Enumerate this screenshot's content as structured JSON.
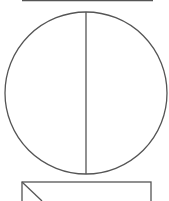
{
  "diagram": {
    "stroke_color": "#555555",
    "background": "#ffffff",
    "top_shape_edge": {
      "x1": 22,
      "y1": 0.5,
      "x2": 153,
      "y2": 0.5
    },
    "circle": {
      "cx": 86,
      "cy": 93,
      "r": 81
    },
    "diameter": {
      "x1": 86,
      "y1": 12,
      "x2": 86,
      "y2": 174
    },
    "bottom_rectangle": {
      "x": 22,
      "y": 182,
      "width": 129,
      "height": 40
    },
    "bottom_diagonal": {
      "x1": 22,
      "y1": 182,
      "x2": 42,
      "y2": 201
    }
  }
}
